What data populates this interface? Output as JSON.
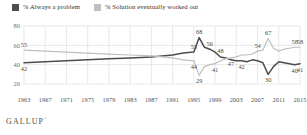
{
  "legend": {
    "items": [
      {
        "label": "% Always a problem",
        "color": "#4d4d4d",
        "key": "always_problem"
      },
      {
        "label": "% Solution eventually worked out",
        "color": "#bfbfbf",
        "key": "solution_worked"
      }
    ]
  },
  "footer": {
    "brand": "GALLUP",
    "mark": "°"
  },
  "colors": {
    "dark_series": "#4d4d4d",
    "light_series": "#bfbfbf",
    "grid": "#d8d8d8",
    "axis_text": "#6f6f6f",
    "label_text": "#4a4a4a",
    "background": "#ffffff"
  },
  "chart_data": {
    "type": "line",
    "title": "",
    "xlabel": "",
    "ylabel": "",
    "xlim": [
      1963,
      2015
    ],
    "ylim": [
      20,
      80
    ],
    "yticks": [
      20,
      40,
      60,
      80
    ],
    "xticks": [
      1963,
      1967,
      1971,
      1975,
      1979,
      1983,
      1987,
      1991,
      1995,
      1999,
      2003,
      2007,
      2011,
      2015
    ],
    "grid": true,
    "legend_position": "top-left",
    "series": [
      {
        "name": "% Always a problem",
        "color": "#4d4d4d",
        "x": [
          1963,
          1967,
          1971,
          1975,
          1979,
          1983,
          1987,
          1991,
          1993,
          1995,
          1996,
          1997,
          1998,
          1999,
          2000,
          2001,
          2002,
          2003,
          2004,
          2005,
          2006,
          2007,
          2008,
          2009,
          2010,
          2011,
          2012,
          2013,
          2014,
          2015
        ],
        "values": [
          42,
          43,
          44,
          45,
          46,
          47,
          48,
          50,
          52,
          53,
          68,
          58,
          56,
          53,
          48,
          47,
          45,
          44,
          44,
          43,
          45,
          44,
          42,
          30,
          38,
          43,
          42,
          41,
          40,
          41
        ],
        "labels": [
          {
            "x": 1963,
            "y": 42,
            "text": "42",
            "pos": "below"
          },
          {
            "x": 1995,
            "y": 53,
            "text": "53",
            "pos": "above"
          },
          {
            "x": 1996,
            "y": 68,
            "text": "68",
            "pos": "above"
          },
          {
            "x": 1998,
            "y": 56,
            "text": "56",
            "pos": "above"
          },
          {
            "x": 2000,
            "y": 48,
            "text": "48",
            "pos": "above"
          },
          {
            "x": 2004,
            "y": 44,
            "text": "42",
            "pos": "below"
          },
          {
            "x": 2009,
            "y": 30,
            "text": "30",
            "pos": "below"
          },
          {
            "x": 2014,
            "y": 40,
            "text": "40",
            "pos": "below"
          },
          {
            "x": 2015,
            "y": 41,
            "text": "41",
            "pos": "below"
          }
        ]
      },
      {
        "name": "% Solution eventually worked out",
        "color": "#bfbfbf",
        "x": [
          1963,
          1967,
          1971,
          1975,
          1979,
          1983,
          1987,
          1991,
          1993,
          1995,
          1996,
          1997,
          1998,
          1999,
          2000,
          2001,
          2002,
          2003,
          2004,
          2005,
          2006,
          2007,
          2008,
          2009,
          2010,
          2011,
          2012,
          2013,
          2014,
          2015
        ],
        "values": [
          55,
          54,
          53,
          52,
          51,
          50,
          49,
          47,
          45,
          44,
          29,
          38,
          40,
          41,
          44,
          46,
          47,
          48,
          50,
          50,
          51,
          54,
          55,
          67,
          57,
          54,
          56,
          57,
          58,
          58
        ],
        "labels": [
          {
            "x": 1963,
            "y": 55,
            "text": "55",
            "pos": "above"
          },
          {
            "x": 1995,
            "y": 44,
            "text": "44",
            "pos": "below"
          },
          {
            "x": 1996,
            "y": 29,
            "text": "29",
            "pos": "below"
          },
          {
            "x": 1999,
            "y": 41,
            "text": "41",
            "pos": "below"
          },
          {
            "x": 2002,
            "y": 47,
            "text": "47",
            "pos": "below"
          },
          {
            "x": 2007,
            "y": 54,
            "text": "54",
            "pos": "above"
          },
          {
            "x": 2009,
            "y": 67,
            "text": "67",
            "pos": "above"
          },
          {
            "x": 2014,
            "y": 58,
            "text": "58",
            "pos": "above"
          },
          {
            "x": 2015,
            "y": 58,
            "text": "58",
            "pos": "above"
          }
        ]
      }
    ]
  }
}
